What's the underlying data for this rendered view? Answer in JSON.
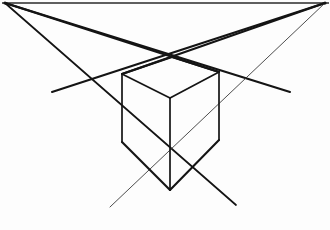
{
  "figure": {
    "title": "Two-Point Perspective Cube Construction",
    "medium": "graphite line drawing on white paper",
    "background_color": "#fdfdfd",
    "ink_color": "#141414",
    "canvas": {
      "width": 330,
      "height": 230
    }
  },
  "horizon": {
    "name": "horizon-line",
    "y": 3,
    "x_start": 2,
    "x_end": 329,
    "color": "#2a2a2a"
  },
  "vanishing_points": [
    {
      "id": "vpl",
      "label": "left vanishing point",
      "x": 5,
      "y": 3
    },
    {
      "id": "vpr",
      "label": "right vanishing point",
      "x": 325,
      "y": 3
    }
  ],
  "vertices": {
    "front_top": {
      "x": 172,
      "y": 57
    },
    "left_top": {
      "x": 122,
      "y": 74
    },
    "right_top": {
      "x": 219,
      "y": 72
    },
    "near_top": {
      "x": 170,
      "y": 98
    },
    "left_bottom": {
      "x": 122,
      "y": 142
    },
    "right_bottom": {
      "x": 219,
      "y": 140
    },
    "near_bottom": {
      "x": 170,
      "y": 190
    },
    "left_line_end": {
      "x": 52,
      "y": 92
    },
    "right_line_end": {
      "x": 290,
      "y": 92
    },
    "left_cross": {
      "x": 78,
      "y": 89
    },
    "right_cross": {
      "x": 272,
      "y": 88
    }
  },
  "edges": [
    {
      "name": "edge-top-left-to-front",
      "x1": 122,
      "y1": 74,
      "x2": 172,
      "y2": 57,
      "weight": "heavy"
    },
    {
      "name": "edge-top-front-to-right",
      "x1": 172,
      "y1": 57,
      "x2": 219,
      "y2": 72,
      "weight": "heavy"
    },
    {
      "name": "edge-top-left-to-near",
      "x1": 122,
      "y1": 74,
      "x2": 170,
      "y2": 98,
      "weight": "med"
    },
    {
      "name": "edge-top-right-to-near",
      "x1": 219,
      "y1": 72,
      "x2": 170,
      "y2": 98,
      "weight": "med"
    },
    {
      "name": "edge-vertical-left",
      "x1": 122,
      "y1": 74,
      "x2": 122,
      "y2": 142,
      "weight": "med"
    },
    {
      "name": "edge-vertical-right",
      "x1": 219,
      "y1": 72,
      "x2": 219,
      "y2": 140,
      "weight": "med"
    },
    {
      "name": "edge-vertical-near",
      "x1": 170,
      "y1": 98,
      "x2": 170,
      "y2": 190,
      "weight": "med"
    },
    {
      "name": "edge-bottom-left-to-near",
      "x1": 122,
      "y1": 142,
      "x2": 170,
      "y2": 190,
      "weight": "heavy"
    },
    {
      "name": "edge-bottom-right-to-near",
      "x1": 219,
      "y1": 140,
      "x2": 170,
      "y2": 190,
      "weight": "heavy"
    }
  ],
  "construction_lines": [
    {
      "name": "construction-vpl-to-top-right-extended",
      "from": "vpl",
      "x1": 5,
      "y1": 3,
      "x2": 290,
      "y2": 92,
      "weight": "heavy"
    },
    {
      "name": "construction-vpl-to-near-top",
      "from": "vpl",
      "x1": 5,
      "y1": 3,
      "x2": 219,
      "y2": 72,
      "weight": "heavy"
    },
    {
      "name": "construction-vpl-to-bottom-right",
      "from": "vpl",
      "x1": 5,
      "y1": 3,
      "x2": 236,
      "y2": 205,
      "weight": "med"
    },
    {
      "name": "construction-vpr-to-top-left-extended",
      "from": "vpr",
      "x1": 325,
      "y1": 3,
      "x2": 52,
      "y2": 92,
      "weight": "heavy"
    },
    {
      "name": "construction-vpr-to-near-top",
      "from": "vpr",
      "x1": 325,
      "y1": 3,
      "x2": 122,
      "y2": 74,
      "weight": "heavy"
    },
    {
      "name": "construction-vpr-to-bottom-left",
      "from": "vpr",
      "x1": 325,
      "y1": 3,
      "x2": 110,
      "y2": 207,
      "weight": "faint"
    }
  ],
  "legend": {
    "note": "no text labels appear in the drawing",
    "visible_text": ""
  }
}
